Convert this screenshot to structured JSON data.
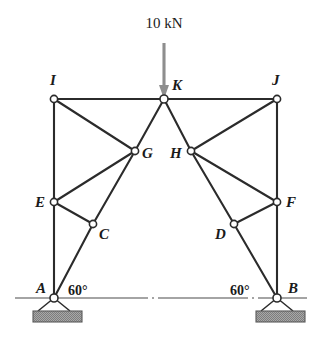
{
  "figure": {
    "background_color": "#ffffff",
    "member_color": "#2b2b2b",
    "arrow_color": "#8e8e8e",
    "joint_fill": "#ffffff",
    "support_base_color": "#a8a8a8",
    "ground_line_color": "#4a4a4a"
  },
  "load": {
    "label": "10 kN",
    "magnitude": 10,
    "unit": "kN",
    "direction": "down",
    "applied_at": "K",
    "label_x": 164,
    "label_y": 27,
    "shaft_x": 164,
    "shaft_y1": 43,
    "shaft_y2": 88,
    "head_y": 99
  },
  "angles": [
    {
      "label": "60°",
      "at_joint": "A",
      "x": 68,
      "y": 290
    },
    {
      "label": "60°",
      "at_joint": "B",
      "x": 233,
      "y": 290
    }
  ],
  "ground": {
    "y": 298,
    "x1": 15,
    "x2": 307,
    "style": "dash-dot-centerline"
  },
  "joints": [
    {
      "id": "A",
      "x": 54,
      "y": 298,
      "label": "A",
      "label_x": 36,
      "label_y": 293,
      "support": "pin"
    },
    {
      "id": "B",
      "x": 277,
      "y": 298,
      "label": "B",
      "label_x": 288,
      "label_y": 293,
      "support": "pin"
    },
    {
      "id": "C",
      "x": 93,
      "y": 224,
      "label": "C",
      "label_x": 99,
      "label_y": 239,
      "support": "none"
    },
    {
      "id": "D",
      "x": 234,
      "y": 224,
      "label": "D",
      "label_x": 215,
      "label_y": 239,
      "support": "none"
    },
    {
      "id": "E",
      "x": 54,
      "y": 202,
      "label": "E",
      "label_x": 35,
      "label_y": 205,
      "support": "none"
    },
    {
      "id": "F",
      "x": 277,
      "y": 202,
      "label": "F",
      "label_x": 286,
      "label_y": 205,
      "support": "none"
    },
    {
      "id": "G",
      "x": 135,
      "y": 151,
      "label": "G",
      "label_x": 142,
      "label_y": 158,
      "support": "none"
    },
    {
      "id": "H",
      "x": 191,
      "y": 151,
      "label": "H",
      "label_x": 170,
      "label_y": 158,
      "support": "none"
    },
    {
      "id": "I",
      "x": 54,
      "y": 99,
      "label": "I",
      "label_x": 52,
      "label_y": 83,
      "support": "none"
    },
    {
      "id": "J",
      "x": 277,
      "y": 99,
      "label": "J",
      "label_x": 275,
      "label_y": 83,
      "support": "none"
    },
    {
      "id": "K",
      "x": 164,
      "y": 99,
      "label": "K",
      "label_x": 173,
      "label_y": 89,
      "support": "none"
    }
  ],
  "members": [
    {
      "from": "I",
      "to": "K"
    },
    {
      "from": "K",
      "to": "J"
    },
    {
      "from": "I",
      "to": "E"
    },
    {
      "from": "E",
      "to": "A"
    },
    {
      "from": "J",
      "to": "F"
    },
    {
      "from": "F",
      "to": "B"
    },
    {
      "from": "I",
      "to": "G"
    },
    {
      "from": "E",
      "to": "G"
    },
    {
      "from": "E",
      "to": "C"
    },
    {
      "from": "C",
      "to": "G"
    },
    {
      "from": "A",
      "to": "C"
    },
    {
      "from": "C",
      "to": "G"
    },
    {
      "from": "G",
      "to": "K"
    },
    {
      "from": "J",
      "to": "H"
    },
    {
      "from": "F",
      "to": "H"
    },
    {
      "from": "F",
      "to": "D"
    },
    {
      "from": "D",
      "to": "H"
    },
    {
      "from": "B",
      "to": "D"
    },
    {
      "from": "H",
      "to": "K"
    }
  ],
  "supports": [
    {
      "at_joint": "A",
      "type": "pin",
      "apex_x": 54,
      "apex_y": 298,
      "leg_left_x": 38,
      "leg_right_x": 70,
      "leg_y": 311,
      "base_x": 33,
      "base_y": 311,
      "base_w": 49,
      "base_h": 11
    },
    {
      "at_joint": "B",
      "type": "pin",
      "apex_x": 277,
      "apex_y": 298,
      "leg_left_x": 261,
      "leg_right_x": 293,
      "leg_y": 311,
      "base_x": 256,
      "base_y": 311,
      "base_w": 49,
      "base_h": 11
    }
  ]
}
